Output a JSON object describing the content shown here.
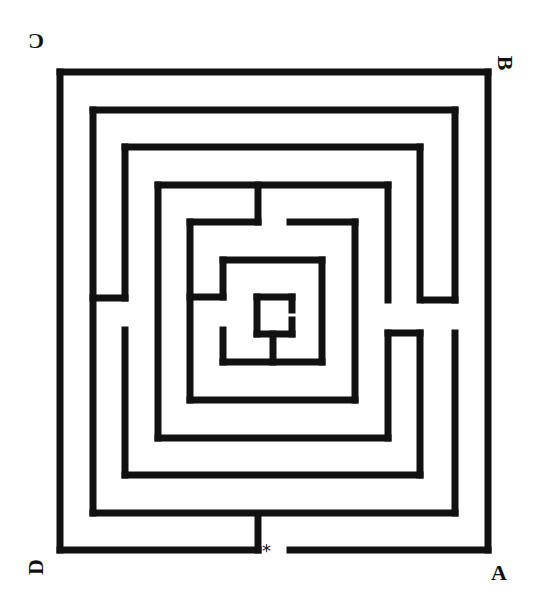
{
  "diagram": {
    "type": "maze",
    "stroke_color": "#111111",
    "background": "#ffffff",
    "stroke_width": 7,
    "labels": {
      "top_left": "C",
      "top_right": "B",
      "bottom_left": "D",
      "bottom_right": "A",
      "entrance_marker": "*"
    },
    "walls": [
      [
        60,
        72,
        488,
        72
      ],
      [
        488,
        72,
        488,
        550
      ],
      [
        290,
        550,
        488,
        550
      ],
      [
        60,
        72,
        60,
        550
      ],
      [
        60,
        550,
        258,
        550
      ],
      [
        258,
        515,
        258,
        550
      ],
      [
        93,
        110,
        455,
        110
      ],
      [
        455,
        110,
        455,
        300
      ],
      [
        93,
        110,
        93,
        513
      ],
      [
        93,
        513,
        455,
        513
      ],
      [
        455,
        333,
        455,
        513
      ],
      [
        93,
        298,
        125,
        298
      ],
      [
        425,
        300,
        455,
        300
      ],
      [
        125,
        147,
        420,
        147
      ],
      [
        420,
        147,
        420,
        300
      ],
      [
        125,
        147,
        125,
        298
      ],
      [
        125,
        330,
        125,
        475
      ],
      [
        125,
        475,
        420,
        475
      ],
      [
        420,
        333,
        420,
        475
      ],
      [
        388,
        333,
        420,
        333
      ],
      [
        158,
        185,
        388,
        185
      ],
      [
        388,
        185,
        388,
        300
      ],
      [
        158,
        185,
        158,
        438
      ],
      [
        158,
        438,
        388,
        438
      ],
      [
        388,
        333,
        388,
        438
      ],
      [
        258,
        185,
        258,
        222
      ],
      [
        190,
        222,
        258,
        222
      ],
      [
        190,
        222,
        190,
        400
      ],
      [
        190,
        400,
        355,
        400
      ],
      [
        355,
        222,
        355,
        400
      ],
      [
        290,
        222,
        355,
        222
      ],
      [
        190,
        297,
        223,
        297
      ],
      [
        223,
        260,
        322,
        260
      ],
      [
        223,
        260,
        223,
        297
      ],
      [
        322,
        260,
        322,
        362
      ],
      [
        223,
        330,
        223,
        362
      ],
      [
        223,
        362,
        322,
        362
      ],
      [
        257,
        297,
        292,
        297
      ],
      [
        257,
        297,
        257,
        334
      ],
      [
        257,
        334,
        292,
        334
      ],
      [
        292,
        297,
        292,
        310
      ],
      [
        292,
        320,
        292,
        334
      ],
      [
        273,
        334,
        273,
        362
      ]
    ]
  }
}
